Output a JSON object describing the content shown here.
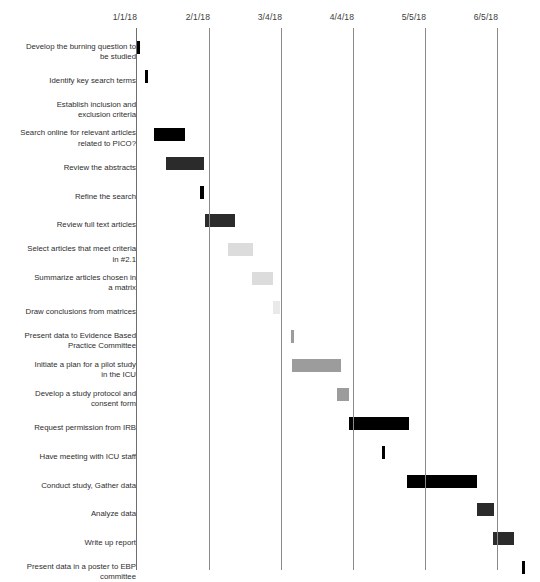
{
  "chart_data": {
    "type": "bar",
    "chart_subtype": "gantt",
    "title": "",
    "xlabel": "",
    "ylabel": "",
    "grid": true,
    "legend": "none",
    "axis": {
      "tick_labels": [
        "1/1/18",
        "2/1/18",
        "3/4/18",
        "4/4/18",
        "5/5/18",
        "6/5/18"
      ],
      "tick_x_px": [
        136,
        209,
        281,
        353,
        425,
        497
      ],
      "xlim_px": [
        136,
        540
      ]
    },
    "categories": [
      "Develop the burning question to\nbe studied",
      "Identify key search terms",
      "Establish inclusion and\nexclusion criteria",
      "Search online for relevant articles\nrelated to PICO?",
      "Review the abstracts",
      "Refine the search",
      "Review full text articles",
      "Select articles that meet criteria\nin #2.1",
      "Summarize articles chosen in\na matrix",
      "Draw conclusions from matrices",
      "Present data to Evidence Based\nPractice Committee",
      "Initiate a plan for a pilot study\nin the ICU",
      "Develop a study protocol and\nconsent form",
      "Request permission from IRB",
      "Have meeting with ICU staff",
      "Conduct study, Gather data",
      "Analyze data",
      "Write up report",
      "Present data in a poster to EBP\ncommittee"
    ],
    "bars": [
      {
        "task": "Develop the burning question to be studied",
        "x_px": 136,
        "width_px": 4,
        "shade": "bar-black",
        "row": 0
      },
      {
        "task": "Identify key search terms",
        "x_px": 145,
        "width_px": 3,
        "shade": "bar-black",
        "row": 1
      },
      {
        "task": "Establish inclusion and exclusion criteria",
        "x_px": 150,
        "width_px": 0,
        "shade": "bar-black",
        "row": 2
      },
      {
        "task": "Search online for relevant articles related to PICO?",
        "x_px": 154,
        "width_px": 31,
        "shade": "bar-black",
        "row": 3
      },
      {
        "task": "Review the abstracts",
        "x_px": 166,
        "width_px": 38,
        "shade": "bar-dark",
        "row": 4
      },
      {
        "task": "Refine the search",
        "x_px": 200,
        "width_px": 4,
        "shade": "bar-black",
        "row": 5
      },
      {
        "task": "Review full text articles",
        "x_px": 205,
        "width_px": 30,
        "shade": "bar-dark",
        "row": 6
      },
      {
        "task": "Select articles that meet criteria in #2.1",
        "x_px": 228,
        "width_px": 25,
        "shade": "bar-light",
        "row": 7
      },
      {
        "task": "Summarize articles chosen in a matrix",
        "x_px": 252,
        "width_px": 21,
        "shade": "bar-light",
        "row": 8
      },
      {
        "task": "Draw conclusions from matrices",
        "x_px": 273,
        "width_px": 7,
        "shade": "bar-xlight",
        "row": 9
      },
      {
        "task": "Present data to Evidence Based Practice Committee",
        "x_px": 291,
        "width_px": 3,
        "shade": "bar-mid",
        "row": 10
      },
      {
        "task": "Initiate a plan for a pilot study in the ICU",
        "x_px": 292,
        "width_px": 49,
        "shade": "bar-mid",
        "row": 11
      },
      {
        "task": "Develop a study protocol and consent form",
        "x_px": 337,
        "width_px": 12,
        "shade": "bar-mid",
        "row": 12
      },
      {
        "task": "Request permission from IRB",
        "x_px": 349,
        "width_px": 60,
        "shade": "bar-black",
        "row": 13
      },
      {
        "task": "Have meeting with ICU staff",
        "x_px": 382,
        "width_px": 3,
        "shade": "bar-black",
        "row": 14
      },
      {
        "task": "Conduct study, Gather data",
        "x_px": 407,
        "width_px": 70,
        "shade": "bar-black",
        "row": 15
      },
      {
        "task": "Analyze data",
        "x_px": 477,
        "width_px": 17,
        "shade": "bar-dark",
        "row": 16
      },
      {
        "task": "Write up report",
        "x_px": 493,
        "width_px": 21,
        "shade": "bar-dark",
        "row": 17
      },
      {
        "task": "Present data in a poster to EBP committee",
        "x_px": 522,
        "width_px": 3,
        "shade": "bar-black",
        "row": 18
      }
    ],
    "colors": {
      "bar_black": "#000000",
      "bar_dark": "#2b2b2b",
      "bar_mid": "#9c9c9c",
      "bar_light": "#dcdcdc",
      "bar_xlight": "#e9e9e9",
      "gridline": "#8a8a8a",
      "text": "#2e2e2e",
      "background": "#ffffff"
    }
  }
}
